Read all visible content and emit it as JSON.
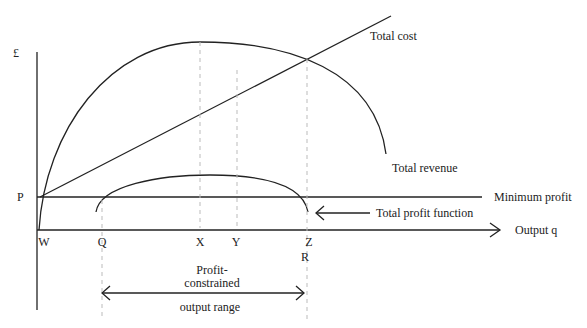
{
  "diagram": {
    "y_axis_label": "£",
    "price_label": "P",
    "x_axis_label": "Output q",
    "points": [
      "W",
      "Q",
      "X",
      "Y",
      "Z",
      "R"
    ],
    "curves": {
      "total_cost": "Total cost",
      "total_revenue": "Total revenue",
      "minimum_profit": "Minimum profit",
      "total_profit": "Total profit function"
    },
    "range_label_line1": "Profit-",
    "range_label_line2": "constrained",
    "range_label_line3": "output range"
  }
}
